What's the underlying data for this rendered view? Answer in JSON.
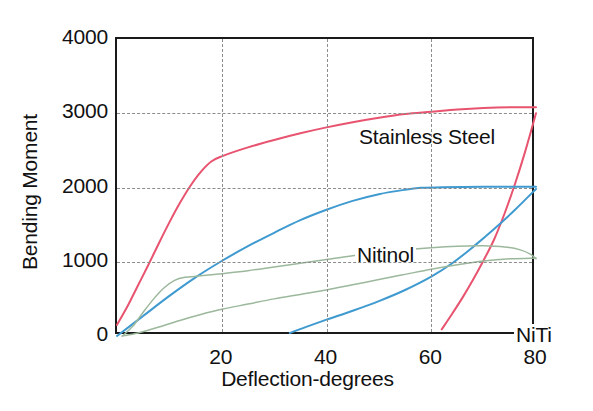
{
  "chart_data": {
    "type": "line",
    "title": "",
    "xlabel": "Deflection-degrees",
    "ylabel": "Bending Moment",
    "xlim": [
      0,
      80
    ],
    "ylim": [
      0,
      4000
    ],
    "xticks": [
      20,
      40,
      60,
      80
    ],
    "yticks": [
      0,
      1000,
      2000,
      3000,
      4000
    ],
    "grid": true,
    "legend_position": "inline-annotations",
    "annotations": [
      {
        "text": "Stainless Steel",
        "x": 31,
        "y": 3180,
        "series": "Stainless Steel"
      },
      {
        "text": "Nitinol",
        "x": 30,
        "y": 1600,
        "series": "Nitinol"
      },
      {
        "text": "NiTi",
        "x": 64,
        "y": 520,
        "series": "NiTi"
      }
    ],
    "series": [
      {
        "name": "Stainless Steel",
        "color": "#e8536f",
        "branch": "loading",
        "points": [
          {
            "x": 0,
            "y": 150
          },
          {
            "x": 2,
            "y": 400
          },
          {
            "x": 4,
            "y": 680
          },
          {
            "x": 6,
            "y": 960
          },
          {
            "x": 8,
            "y": 1250
          },
          {
            "x": 10,
            "y": 1530
          },
          {
            "x": 12,
            "y": 1790
          },
          {
            "x": 14,
            "y": 2020
          },
          {
            "x": 16,
            "y": 2210
          },
          {
            "x": 18,
            "y": 2350
          },
          {
            "x": 20,
            "y": 2420
          },
          {
            "x": 25,
            "y": 2540
          },
          {
            "x": 30,
            "y": 2640
          },
          {
            "x": 35,
            "y": 2730
          },
          {
            "x": 40,
            "y": 2810
          },
          {
            "x": 45,
            "y": 2880
          },
          {
            "x": 50,
            "y": 2940
          },
          {
            "x": 55,
            "y": 2990
          },
          {
            "x": 60,
            "y": 3020
          },
          {
            "x": 65,
            "y": 3050
          },
          {
            "x": 70,
            "y": 3070
          },
          {
            "x": 75,
            "y": 3080
          },
          {
            "x": 80,
            "y": 3080
          }
        ]
      },
      {
        "name": "Stainless Steel",
        "color": "#e8536f",
        "branch": "unloading",
        "points": [
          {
            "x": 80,
            "y": 3000
          },
          {
            "x": 78,
            "y": 2500
          },
          {
            "x": 76,
            "y": 2050
          },
          {
            "x": 74,
            "y": 1650
          },
          {
            "x": 72,
            "y": 1300
          },
          {
            "x": 70,
            "y": 1020
          },
          {
            "x": 68,
            "y": 760
          },
          {
            "x": 66,
            "y": 520
          },
          {
            "x": 64,
            "y": 300
          },
          {
            "x": 62,
            "y": 90
          }
        ]
      },
      {
        "name": "Nitinol",
        "color": "#3f9ad0",
        "branch": "loading",
        "points": [
          {
            "x": 0,
            "y": 0
          },
          {
            "x": 5,
            "y": 270
          },
          {
            "x": 10,
            "y": 540
          },
          {
            "x": 15,
            "y": 790
          },
          {
            "x": 20,
            "y": 1010
          },
          {
            "x": 25,
            "y": 1210
          },
          {
            "x": 30,
            "y": 1390
          },
          {
            "x": 35,
            "y": 1560
          },
          {
            "x": 40,
            "y": 1700
          },
          {
            "x": 45,
            "y": 1820
          },
          {
            "x": 50,
            "y": 1910
          },
          {
            "x": 55,
            "y": 1970
          },
          {
            "x": 58,
            "y": 1995
          },
          {
            "x": 62,
            "y": 2005
          },
          {
            "x": 70,
            "y": 2010
          },
          {
            "x": 80,
            "y": 2010
          }
        ]
      },
      {
        "name": "Nitinol",
        "color": "#3f9ad0",
        "branch": "unloading",
        "points": [
          {
            "x": 80,
            "y": 1980
          },
          {
            "x": 76,
            "y": 1700
          },
          {
            "x": 72,
            "y": 1440
          },
          {
            "x": 68,
            "y": 1200
          },
          {
            "x": 64,
            "y": 980
          },
          {
            "x": 60,
            "y": 800
          },
          {
            "x": 55,
            "y": 620
          },
          {
            "x": 50,
            "y": 470
          },
          {
            "x": 45,
            "y": 340
          },
          {
            "x": 40,
            "y": 220
          },
          {
            "x": 36,
            "y": 120
          },
          {
            "x": 33,
            "y": 40
          }
        ]
      },
      {
        "name": "NiTi",
        "color": "#9cb89c",
        "branch": "upper",
        "points": [
          {
            "x": 1,
            "y": 0
          },
          {
            "x": 3,
            "y": 130
          },
          {
            "x": 5,
            "y": 320
          },
          {
            "x": 7,
            "y": 500
          },
          {
            "x": 9,
            "y": 650
          },
          {
            "x": 11,
            "y": 750
          },
          {
            "x": 13,
            "y": 790
          },
          {
            "x": 16,
            "y": 810
          },
          {
            "x": 20,
            "y": 840
          },
          {
            "x": 25,
            "y": 880
          },
          {
            "x": 30,
            "y": 930
          },
          {
            "x": 35,
            "y": 980
          },
          {
            "x": 40,
            "y": 1030
          },
          {
            "x": 45,
            "y": 1080
          },
          {
            "x": 50,
            "y": 1120
          },
          {
            "x": 55,
            "y": 1160
          },
          {
            "x": 60,
            "y": 1190
          },
          {
            "x": 65,
            "y": 1210
          },
          {
            "x": 70,
            "y": 1215
          },
          {
            "x": 74,
            "y": 1200
          },
          {
            "x": 77,
            "y": 1160
          },
          {
            "x": 79,
            "y": 1100
          },
          {
            "x": 80,
            "y": 1040
          }
        ]
      },
      {
        "name": "NiTi",
        "color": "#9cb89c",
        "branch": "lower",
        "points": [
          {
            "x": 1,
            "y": 0
          },
          {
            "x": 4,
            "y": 40
          },
          {
            "x": 8,
            "y": 120
          },
          {
            "x": 12,
            "y": 210
          },
          {
            "x": 16,
            "y": 290
          },
          {
            "x": 20,
            "y": 360
          },
          {
            "x": 25,
            "y": 430
          },
          {
            "x": 30,
            "y": 500
          },
          {
            "x": 35,
            "y": 560
          },
          {
            "x": 40,
            "y": 620
          },
          {
            "x": 45,
            "y": 690
          },
          {
            "x": 50,
            "y": 760
          },
          {
            "x": 55,
            "y": 830
          },
          {
            "x": 60,
            "y": 900
          },
          {
            "x": 65,
            "y": 960
          },
          {
            "x": 70,
            "y": 1010
          },
          {
            "x": 75,
            "y": 1040
          },
          {
            "x": 80,
            "y": 1050
          }
        ]
      }
    ]
  },
  "axis": {
    "x_tick_labels": [
      "20",
      "40",
      "60",
      "80"
    ],
    "y_tick_labels": [
      "4000",
      "3000",
      "2000",
      "1000",
      "0"
    ],
    "x_title": "Deflection-degrees",
    "y_title": "Bending Moment"
  },
  "colors": {
    "stainless_steel": "#e8536f",
    "nitinol": "#3f9ad0",
    "niti": "#9cb89c",
    "axis": "#1a1a1a",
    "grid": "#8c8c8c",
    "background": "#ffffff"
  }
}
